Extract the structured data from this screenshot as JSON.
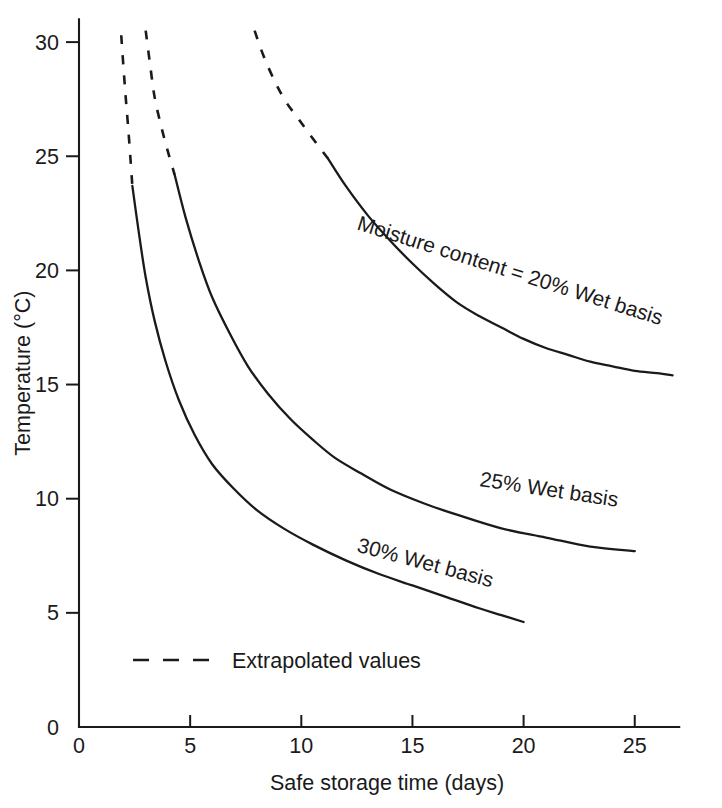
{
  "chart_data": {
    "type": "line",
    "title": "",
    "xlabel": "Safe storage time (days)",
    "ylabel": "Temperature (°C)",
    "xlim": [
      0,
      27
    ],
    "ylim": [
      0,
      31
    ],
    "xticks": [
      0,
      5,
      10,
      15,
      20,
      25
    ],
    "xticklabels": [
      "0",
      "5",
      "10",
      "15",
      "20",
      "25"
    ],
    "yticks": [
      0,
      5,
      10,
      15,
      20,
      25,
      30
    ],
    "yticklabels": [
      "0",
      "5",
      "10",
      "15",
      "20",
      "25",
      "30"
    ],
    "grid": false,
    "legend_position": "inside-lower-left",
    "legend": [
      {
        "label": "Extrapolated values",
        "style": "dashed"
      }
    ],
    "series": [
      {
        "name": "Moisture content = 20% Wet basis",
        "label": "Moisture content = 20% Wet basis",
        "style": "solid-with-dashed-extrapolation",
        "extrapolated_points": [
          [
            7.9,
            30.5
          ],
          [
            8.3,
            29.4
          ],
          [
            8.8,
            28.3
          ],
          [
            9.3,
            27.4
          ],
          [
            9.9,
            26.6
          ],
          [
            10.5,
            25.8
          ],
          [
            11.2,
            24.9
          ]
        ],
        "points": [
          [
            11.2,
            24.9
          ],
          [
            12.0,
            23.7
          ],
          [
            13.0,
            22.4
          ],
          [
            14.0,
            21.3
          ],
          [
            15.0,
            20.3
          ],
          [
            16.0,
            19.4
          ],
          [
            17.0,
            18.6
          ],
          [
            18.0,
            18.0
          ],
          [
            19.0,
            17.5
          ],
          [
            20.0,
            17.0
          ],
          [
            21.0,
            16.6
          ],
          [
            22.0,
            16.3
          ],
          [
            23.0,
            16.0
          ],
          [
            24.0,
            15.8
          ],
          [
            25.0,
            15.6
          ],
          [
            26.0,
            15.5
          ],
          [
            26.7,
            15.4
          ]
        ]
      },
      {
        "name": "25% Wet basis",
        "label": "25% Wet basis",
        "style": "solid-with-dashed-extrapolation",
        "extrapolated_points": [
          [
            3.0,
            30.5
          ],
          [
            3.2,
            29.0
          ],
          [
            3.4,
            27.6
          ],
          [
            3.7,
            26.3
          ],
          [
            4.0,
            25.2
          ],
          [
            4.3,
            24.2
          ]
        ],
        "points": [
          [
            4.3,
            24.2
          ],
          [
            4.8,
            22.3
          ],
          [
            5.4,
            20.4
          ],
          [
            6.0,
            18.8
          ],
          [
            6.8,
            17.2
          ],
          [
            7.6,
            15.8
          ],
          [
            8.5,
            14.6
          ],
          [
            9.5,
            13.5
          ],
          [
            10.5,
            12.6
          ],
          [
            11.5,
            11.8
          ],
          [
            12.7,
            11.1
          ],
          [
            14.0,
            10.4
          ],
          [
            15.5,
            9.8
          ],
          [
            17.0,
            9.3
          ],
          [
            19.0,
            8.7
          ],
          [
            21.0,
            8.3
          ],
          [
            23.0,
            7.9
          ],
          [
            25.0,
            7.7
          ]
        ]
      },
      {
        "name": "30% Wet basis",
        "label": "30% Wet basis",
        "style": "solid-with-dashed-extrapolation",
        "extrapolated_points": [
          [
            1.9,
            30.3
          ],
          [
            2.0,
            28.9
          ],
          [
            2.1,
            27.6
          ],
          [
            2.2,
            26.4
          ],
          [
            2.3,
            25.1
          ],
          [
            2.4,
            23.7
          ]
        ],
        "points": [
          [
            2.4,
            23.7
          ],
          [
            2.7,
            21.6
          ],
          [
            3.0,
            19.7
          ],
          [
            3.4,
            17.8
          ],
          [
            3.9,
            16.0
          ],
          [
            4.5,
            14.3
          ],
          [
            5.2,
            12.8
          ],
          [
            6.0,
            11.5
          ],
          [
            7.0,
            10.4
          ],
          [
            8.0,
            9.5
          ],
          [
            9.2,
            8.7
          ],
          [
            10.5,
            8.0
          ],
          [
            12.0,
            7.3
          ],
          [
            13.5,
            6.7
          ],
          [
            15.0,
            6.2
          ],
          [
            16.5,
            5.7
          ],
          [
            18.0,
            5.2
          ],
          [
            19.0,
            4.9
          ],
          [
            20.0,
            4.6
          ]
        ]
      }
    ],
    "annotations": [
      {
        "text": "Moisture content = 20% Wet basis",
        "x": 19.3,
        "y": 19.7,
        "rotation": 17.5
      },
      {
        "text": "25% Wet basis",
        "x": 21.1,
        "y": 10.1,
        "rotation": 8.5
      },
      {
        "text": "30% Wet basis",
        "x": 15.5,
        "y": 6.9,
        "rotation": 15.0
      }
    ]
  }
}
